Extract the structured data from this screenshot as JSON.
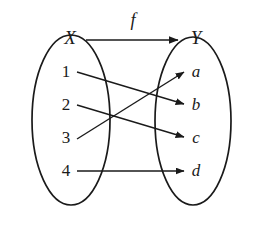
{
  "diagram": {
    "type": "function-mapping-diagram",
    "background_color": "#ffffff",
    "ink_color": "#1a1a1a",
    "map_label": "f",
    "domain": {
      "set_label": "X",
      "elements": [
        "1",
        "2",
        "3",
        "4"
      ]
    },
    "codomain": {
      "set_label": "Y",
      "elements": [
        "a",
        "b",
        "c",
        "d"
      ]
    },
    "mappings": [
      {
        "from": "1",
        "to": "b"
      },
      {
        "from": "2",
        "to": "c"
      },
      {
        "from": "3",
        "to": "a"
      },
      {
        "from": "4",
        "to": "d"
      }
    ]
  }
}
